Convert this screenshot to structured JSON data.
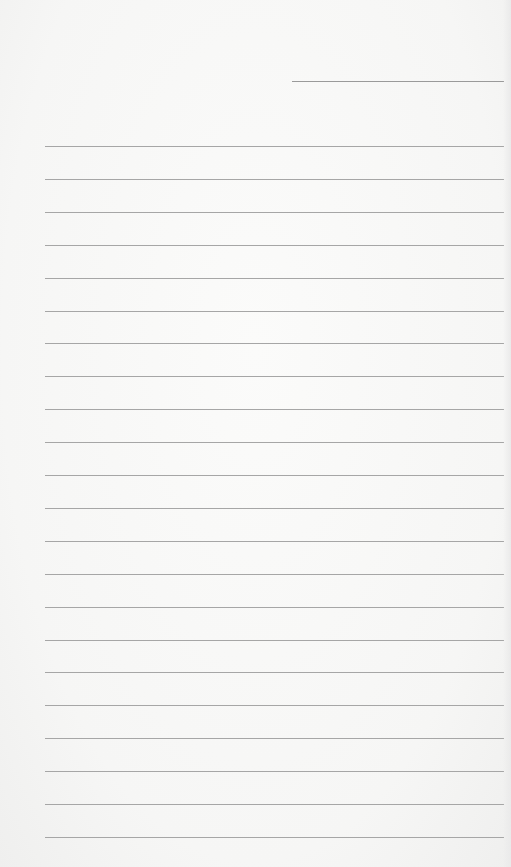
{
  "document": {
    "type": "lined-paper",
    "header_line": {
      "x": 292,
      "y": 81,
      "width": 212
    },
    "ruled_lines": {
      "x": 45,
      "width": 459,
      "start_y": 146,
      "spacing": 32.9,
      "count": 22
    },
    "line_color": "#a6a6a6",
    "paper_color": "#f7f7f6"
  }
}
